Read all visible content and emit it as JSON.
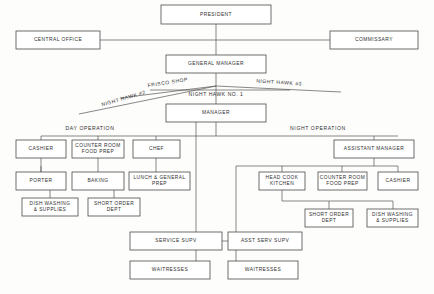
{
  "chart_data": {
    "type": "diagram",
    "diagram_kind": "organizational-hierarchy",
    "nodes": [
      {
        "id": "president",
        "label": "PRESIDENT",
        "x": 161,
        "y": 5,
        "w": 110,
        "h": 19
      },
      {
        "id": "central_office",
        "label": "CENTRAL OFFICE",
        "x": 16,
        "y": 31,
        "w": 84,
        "h": 18
      },
      {
        "id": "commissary",
        "label": "COMMISSARY",
        "x": 330,
        "y": 31,
        "w": 88,
        "h": 18
      },
      {
        "id": "general_manager",
        "label": "GENERAL MANAGER",
        "x": 166,
        "y": 55,
        "w": 100,
        "h": 18
      },
      {
        "id": "manager",
        "label": "MANAGER",
        "x": 166,
        "y": 104,
        "w": 100,
        "h": 18
      },
      {
        "id": "day_cashier",
        "label": "CASHIER",
        "x": 16,
        "y": 140,
        "w": 50,
        "h": 18
      },
      {
        "id": "day_counter_room",
        "label": "COUNTER ROOM|FOOD PREP",
        "x": 72,
        "y": 140,
        "w": 52,
        "h": 18
      },
      {
        "id": "day_chef",
        "label": "CHEF",
        "x": 133,
        "y": 140,
        "w": 47,
        "h": 18
      },
      {
        "id": "assistant_manager",
        "label": "ASSISTANT MANAGER",
        "x": 334,
        "y": 140,
        "w": 80,
        "h": 18
      },
      {
        "id": "day_porter",
        "label": "PORTER",
        "x": 16,
        "y": 172,
        "w": 50,
        "h": 18
      },
      {
        "id": "day_baking",
        "label": "BAKING",
        "x": 72,
        "y": 172,
        "w": 52,
        "h": 18
      },
      {
        "id": "day_lunch_prep",
        "label": "LUNCH & GENERAL|PREP",
        "x": 129,
        "y": 172,
        "w": 61,
        "h": 18
      },
      {
        "id": "night_head_cook",
        "label": "HEAD COOK|KITCHEN",
        "x": 259,
        "y": 172,
        "w": 46,
        "h": 18
      },
      {
        "id": "night_counter_room",
        "label": "COUNTER ROOM|FOOD PREP",
        "x": 318,
        "y": 172,
        "w": 49,
        "h": 18
      },
      {
        "id": "night_cashier",
        "label": "CASHIER",
        "x": 378,
        "y": 172,
        "w": 40,
        "h": 18
      },
      {
        "id": "day_dish_washing",
        "label": "DISH WASHING|& SUPPLIES",
        "x": 22,
        "y": 198,
        "w": 56,
        "h": 18
      },
      {
        "id": "day_short_order",
        "label": "SHORT ORDER|DEPT",
        "x": 88,
        "y": 198,
        "w": 52,
        "h": 18
      },
      {
        "id": "night_short_order",
        "label": "SHORT ORDER|DEPT",
        "x": 305,
        "y": 209,
        "w": 48,
        "h": 18
      },
      {
        "id": "night_dish_washing",
        "label": "DISH WASHING|& SUPPLIES",
        "x": 367,
        "y": 209,
        "w": 51,
        "h": 18
      },
      {
        "id": "service_supv",
        "label": "SERVICE SUPV",
        "x": 130,
        "y": 232,
        "w": 92,
        "h": 18
      },
      {
        "id": "asst_serv_supv",
        "label": "ASST  SERV  SUPV",
        "x": 228,
        "y": 232,
        "w": 74,
        "h": 18
      },
      {
        "id": "day_waitresses",
        "label": "WAITRESSES",
        "x": 130,
        "y": 261,
        "w": 80,
        "h": 18
      },
      {
        "id": "night_waitresses",
        "label": "WAITRESSES",
        "x": 228,
        "y": 261,
        "w": 70,
        "h": 18
      }
    ],
    "section_labels": [
      {
        "id": "day_operation",
        "label": "DAY OPERATION",
        "x": 90,
        "y": 130
      },
      {
        "id": "night_operation",
        "label": "NIGHT OPERATION",
        "x": 318,
        "y": 130
      }
    ],
    "branch_labels": [
      {
        "id": "frisco_shop",
        "label": "FRISCO SHOP",
        "x": 168,
        "y": 84,
        "rotate": -9
      },
      {
        "id": "night_hawk_2",
        "label": "NIGHT HAWK #2",
        "x": 124,
        "y": 100,
        "rotate": -16
      },
      {
        "id": "night_hawk_3",
        "label": "NIGHT HAWK #3",
        "x": 279,
        "y": 84,
        "rotate": 4
      },
      {
        "id": "night_hawk_1",
        "label": "NIGHT HAWK  NO. 1",
        "x": 216,
        "y": 96,
        "rotate": 0
      }
    ],
    "edges": [
      "president-to-general-manager",
      "central-office-to-trunk",
      "commissary-to-trunk",
      "general-manager-to-branch-hub",
      "branch-hub-to-frisco-shop",
      "branch-hub-to-night-hawk-2",
      "branch-hub-to-night-hawk-3",
      "branch-hub-to-manager",
      "manager-to-operations-bus",
      "day-operation-bus-to-children",
      "night-operation-bus-to-children",
      "chef-to-lunch-prep",
      "counter-room-to-baking-and-porter",
      "baking-to-dish-washing",
      "lunch-prep-to-short-order",
      "head-cook-to-night-short-order",
      "assistant-manager-to-night-dish-washing",
      "manager-to-service-supv",
      "assistant-manager-to-asst-serv-supv",
      "service-supv-to-asst-serv-supv",
      "service-supv-to-day-waitresses",
      "asst-serv-supv-to-night-waitresses"
    ],
    "colors": {
      "background": "#fdfdfc",
      "box_fill": "#ffffff",
      "box_stroke": "#4a4a4a",
      "line": "#555555",
      "text": "#2e2e2e"
    }
  }
}
